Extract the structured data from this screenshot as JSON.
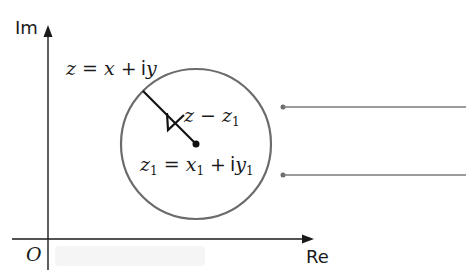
{
  "diagram": {
    "type": "argand-diagram-circle",
    "axes": {
      "imaginary_label": "Im",
      "real_label": "Re",
      "origin_label": "O"
    },
    "labels": {
      "general_point": {
        "lhs": "z",
        "eq": "=",
        "x": "x",
        "plus": "+",
        "i": "i",
        "y": "y"
      },
      "radius_vector": {
        "z": "z",
        "minus": "−",
        "z1": "z",
        "z1_sub": "1"
      },
      "center_point": {
        "z1": "z",
        "z1_sub": "1",
        "eq": "=",
        "x1": "x",
        "x1_sub": "1",
        "plus": "+",
        "i": "i",
        "y1": "y",
        "y1_sub": "1"
      }
    },
    "colors": {
      "axis": "#1a1a1a",
      "circle": "#6b6b6b",
      "radius_arrow": "#111111",
      "leader_lines": "#7a7a7a",
      "background": "#ffffff"
    },
    "leader_lines": [
      {
        "name": "upper-leader-line"
      },
      {
        "name": "lower-leader-line"
      }
    ]
  }
}
